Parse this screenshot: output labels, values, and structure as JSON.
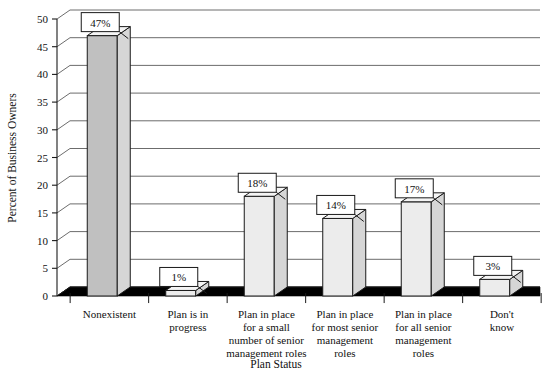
{
  "chart_data": {
    "type": "bar",
    "title": "",
    "xlabel": "Plan Status",
    "ylabel": "Percent of Business Owners",
    "categories": [
      "Nonexistent",
      "Plan is in progress",
      "Plan in place for a small number of senior management roles",
      "Plan in place for most senior management roles",
      "Plan in place for all senior management roles",
      "Don't know"
    ],
    "category_lines": [
      [
        "Nonexistent"
      ],
      [
        "Plan is in",
        "progress"
      ],
      [
        "Plan in place",
        "for a small",
        "number of senior",
        "management roles"
      ],
      [
        "Plan in place",
        "for most senior",
        "management",
        "roles"
      ],
      [
        "Plan in place",
        "for all senior",
        "management",
        "roles"
      ],
      [
        "Don't",
        "know"
      ]
    ],
    "values": [
      47,
      1,
      18,
      14,
      17,
      3
    ],
    "data_labels": [
      "47%",
      "1%",
      "18%",
      "14%",
      "17%",
      "3%"
    ],
    "ylim": [
      0,
      50
    ],
    "yticks": [
      0,
      5,
      10,
      15,
      20,
      25,
      30,
      35,
      40,
      45,
      50
    ],
    "ytick_labels": [
      "0",
      "5",
      "10",
      "15",
      "20",
      "25",
      "30",
      "35",
      "40",
      "45",
      "50"
    ],
    "grid": true,
    "legend": "none",
    "style": "3d-column",
    "colors": {
      "bar_front_highlight": "#c0c0c0",
      "bar_front_default": "#ececec",
      "bar_side": "#d6d6d6",
      "bar_top": "#f4f4f4",
      "outline": "#1a1a1a",
      "gridline": "#5b5b5b",
      "floor": "#000000",
      "background": "#ffffff",
      "label_box_fill": "#ffffff"
    }
  }
}
